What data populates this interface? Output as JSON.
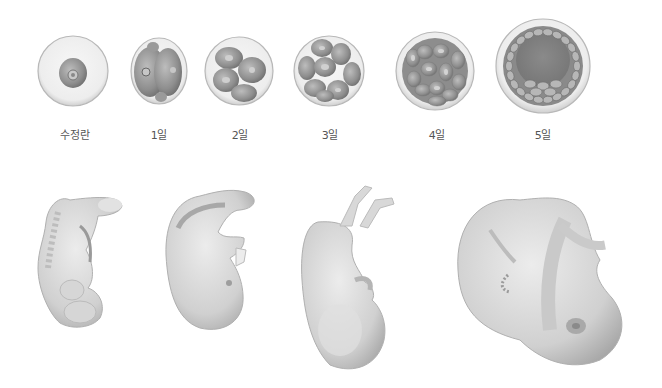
{
  "early_stages": [
    {
      "label": "수정란",
      "cells": 1
    },
    {
      "label": "1일",
      "cells": 2
    },
    {
      "label": "2일",
      "cells": 4
    },
    {
      "label": "3일",
      "cells": 8
    },
    {
      "label": "4일",
      "cells": 16
    },
    {
      "label": "5일",
      "cells": "blastocyst"
    }
  ],
  "later_stages": [
    {
      "name": "early-embryo"
    },
    {
      "name": "embryo-with-limb-buds"
    },
    {
      "name": "fetus-early"
    },
    {
      "name": "fetus-late"
    }
  ],
  "colors": {
    "background": "#ffffff",
    "outline": "#b8b8b8",
    "cell_dark": "#8a8a8a",
    "cell_mid": "#a9a9a9",
    "cell_light": "#d2d2d2",
    "body": "#d9d9d9",
    "body_shadow": "#b3b3b3",
    "label_text": "#555555"
  }
}
